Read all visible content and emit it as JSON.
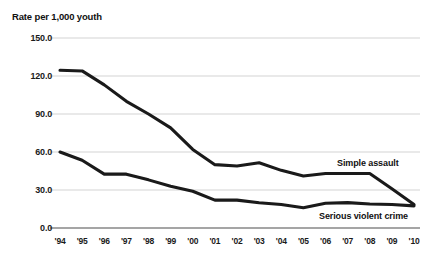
{
  "chart_data": {
    "type": "line",
    "title": "Rate per 1,000 youth",
    "xlabel": "",
    "ylabel": "Rate per 1,000 youth",
    "ylim": [
      0,
      150
    ],
    "yticks": [
      "0.0",
      "30.0",
      "60.0",
      "90.0",
      "120.0",
      "150.0"
    ],
    "ytick_values": [
      0,
      30,
      60,
      90,
      120,
      150
    ],
    "grid": true,
    "legend_position": "inline-right",
    "x": [
      1994,
      1995,
      1996,
      1997,
      1998,
      1999,
      2000,
      2001,
      2002,
      2003,
      2004,
      2005,
      2006,
      2007,
      2008,
      2009,
      2010
    ],
    "categories": [
      "'94",
      "'95",
      "'96",
      "'97",
      "'98",
      "'99",
      "'00",
      "'01",
      "'02",
      "'03",
      "'04",
      "'05",
      "'06",
      "'07",
      "'08",
      "'09",
      "'10"
    ],
    "series": [
      {
        "name": "Simple assault",
        "values": [
          124.5,
          124.0,
          113.0,
          100.0,
          90.0,
          79.0,
          62.0,
          50.0,
          49.0,
          51.5,
          45.5,
          41.0,
          43.0,
          43.0,
          43.0,
          31.0,
          18.5
        ]
      },
      {
        "name": "Serious violent crime",
        "values": [
          60.0,
          53.5,
          42.5,
          42.5,
          38.0,
          33.0,
          29.0,
          22.0,
          22.0,
          20.0,
          18.5,
          16.0,
          19.5,
          20.0,
          19.0,
          18.5,
          17.5
        ]
      }
    ],
    "colors": {
      "line": "#1a1a1a",
      "grid": "#c8c8c8",
      "axis": "#4d4d4d",
      "text": "#111111",
      "background": "#ffffff"
    }
  },
  "annotations": {
    "simple_assault_label": "Simple assault",
    "serious_violent_crime_label": "Serious violent crime"
  }
}
